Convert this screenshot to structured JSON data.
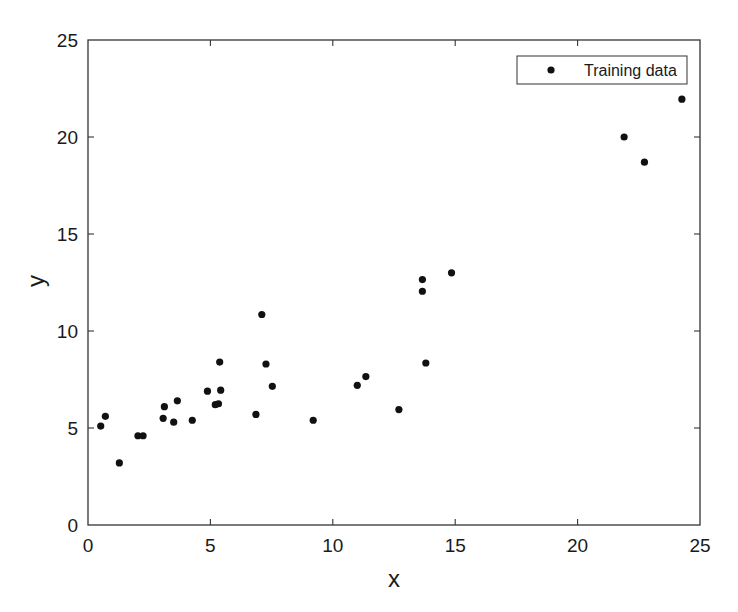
{
  "chart_data": {
    "type": "scatter",
    "title": "",
    "xlabel": "x",
    "ylabel": "y",
    "xlim": [
      0,
      25
    ],
    "ylim": [
      0,
      25
    ],
    "xticks": [
      0,
      5,
      10,
      15,
      20,
      25
    ],
    "yticks": [
      0,
      5,
      10,
      15,
      20,
      25
    ],
    "grid": false,
    "legend": {
      "position": "upper right",
      "entries": [
        "Training data"
      ]
    },
    "series": [
      {
        "name": "Training data",
        "marker": "dot",
        "color": "#111111",
        "points": [
          [
            0.52,
            5.1
          ],
          [
            0.71,
            5.6
          ],
          [
            1.28,
            3.2
          ],
          [
            2.04,
            4.6
          ],
          [
            2.25,
            4.6
          ],
          [
            3.07,
            5.5
          ],
          [
            3.12,
            6.1
          ],
          [
            3.5,
            5.3
          ],
          [
            3.65,
            6.4
          ],
          [
            4.26,
            5.4
          ],
          [
            4.88,
            6.9
          ],
          [
            5.2,
            6.2
          ],
          [
            5.33,
            6.25
          ],
          [
            5.38,
            8.4
          ],
          [
            5.42,
            6.95
          ],
          [
            6.86,
            5.7
          ],
          [
            7.1,
            10.85
          ],
          [
            7.27,
            8.3
          ],
          [
            7.53,
            7.15
          ],
          [
            9.2,
            5.4
          ],
          [
            11.0,
            7.2
          ],
          [
            11.35,
            7.65
          ],
          [
            12.7,
            5.95
          ],
          [
            13.66,
            12.65
          ],
          [
            13.66,
            12.05
          ],
          [
            13.8,
            8.35
          ],
          [
            14.85,
            13.0
          ],
          [
            21.9,
            20.0
          ],
          [
            22.73,
            18.7
          ],
          [
            24.26,
            21.95
          ]
        ]
      }
    ]
  },
  "axes": {
    "x_label": "x",
    "y_label": "y",
    "x_tick_labels": [
      "0",
      "5",
      "10",
      "15",
      "20",
      "25"
    ],
    "y_tick_labels": [
      "0",
      "5",
      "10",
      "15",
      "20",
      "25"
    ]
  },
  "legend": {
    "label": "Training data"
  },
  "colors": {
    "marker": "#111111",
    "axis": "#333333",
    "background": "#ffffff"
  }
}
